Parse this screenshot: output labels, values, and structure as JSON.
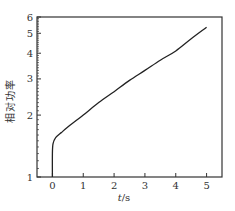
{
  "chart_data": {
    "type": "line",
    "title": "",
    "xlabel": "t/s",
    "ylabel": "相对功率",
    "xlim": [
      -0.5,
      5.5
    ],
    "ylim": [
      1,
      6
    ],
    "yscale": "log",
    "grid": false,
    "legend": null,
    "x_ticks": [
      0,
      1,
      2,
      3,
      4,
      5
    ],
    "y_ticks": [
      1,
      2,
      3,
      4,
      5,
      6
    ],
    "series": [
      {
        "name": "relative power",
        "color": "#222222",
        "x": [
          0,
          0,
          0.02,
          0.1,
          0.3,
          0.5,
          1.0,
          1.5,
          2.0,
          2.5,
          3.0,
          3.5,
          4.0,
          4.5,
          5.0
        ],
        "values": [
          1.0,
          1.3,
          1.45,
          1.55,
          1.65,
          1.75,
          2.0,
          2.3,
          2.6,
          2.95,
          3.3,
          3.7,
          4.1,
          4.7,
          5.35
        ]
      }
    ]
  },
  "labels": {
    "x_axis_title_italic": "t",
    "x_axis_title_unit": "/s",
    "y_axis_title": "相对功率",
    "x_tick_labels": [
      "0",
      "1",
      "2",
      "3",
      "4",
      "5"
    ],
    "y_tick_labels": [
      "1",
      "2",
      "3",
      "4",
      "5",
      "6"
    ]
  },
  "colors": {
    "axis": "#333333",
    "line": "#222222",
    "background": "#ffffff"
  }
}
